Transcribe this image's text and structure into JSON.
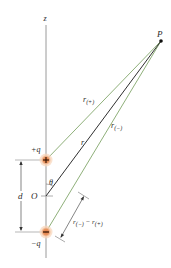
{
  "diagram": {
    "axis_label": "z",
    "point_label": "P",
    "origin_label": "O",
    "angle_label": "θ",
    "separation_label": "d",
    "positive_charge": {
      "label": "+q",
      "symbol": "+"
    },
    "negative_charge": {
      "label": "−q",
      "symbol": "−"
    },
    "distances": {
      "r_plus": {
        "main": "r",
        "sub": "(+)"
      },
      "r": {
        "main": "r"
      },
      "r_minus": {
        "main": "r",
        "sub": "(−)"
      },
      "difference": {
        "main1": "r",
        "sub1": "(−)",
        "op": " − ",
        "main2": "r",
        "sub2": "(+)"
      }
    },
    "colors": {
      "axis": "#9a9a9a",
      "green_line": "#8fb07a",
      "r_line": "#2f2f2f",
      "charge_fill": "#e8894f",
      "charge_glow": "#f6c9a6",
      "text": "#2a2a2a"
    }
  }
}
